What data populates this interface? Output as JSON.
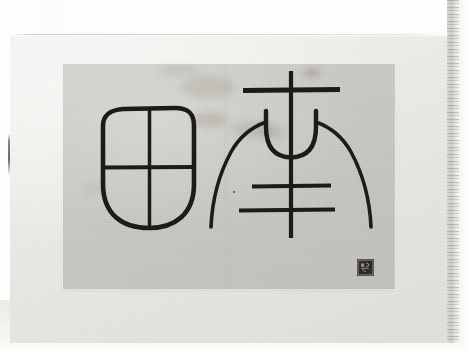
{
  "photo": {
    "subject": "Framed ink rubbing of two ancient Chinese seal-script characters",
    "medium": "ink rubbing on paper, mounted on grey board",
    "background_color": "#fdfdfc",
    "mount_color": "#e9e9e4",
    "print_paper_color": "#c9c9c4",
    "ink_color": "#1a1a18",
    "seal_color": "#2c2724"
  },
  "mount": {
    "label": "grey mounting board"
  },
  "print": {
    "label": "ink rubbing sheet",
    "fold_label": "vertical centre fold",
    "stain_label": "foxing stain"
  },
  "glyphs": [
    {
      "id": "glyph-left",
      "name": "seal-script-tian",
      "transcription": "田",
      "reading": "tián",
      "meaning": "field",
      "description": "rounded square enclosure with rounded base, divided by one vertical and one horizontal stroke"
    },
    {
      "id": "glyph-right",
      "name": "seal-script-di",
      "transcription": "帝",
      "reading": "dì",
      "meaning": "emperor / deity",
      "description": "long vertical shaft crossed by three horizontal bars, with a bowl-shaped curve and two flaring outer arms"
    }
  ],
  "seal": {
    "label": "collector's seal impression",
    "position": "bottom-right of the rubbing"
  },
  "page": {
    "guide_line_label": "faint ruled guide line",
    "left_tick_label": "underlying sheet edge",
    "right_edge_label": "page edge / binding"
  }
}
